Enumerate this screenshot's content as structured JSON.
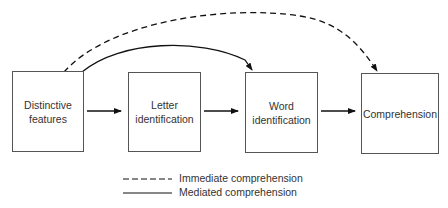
{
  "diagram": {
    "nodes": [
      {
        "id": "distinctive-features",
        "label": "Distinctive\nfeatures"
      },
      {
        "id": "letter-identification",
        "label": "Letter\nidentification"
      },
      {
        "id": "word-identification",
        "label": "Word\nidentification"
      },
      {
        "id": "comprehension",
        "label": "Comprehension"
      }
    ],
    "edges": [
      {
        "from": "distinctive-features",
        "to": "letter-identification",
        "style": "solid"
      },
      {
        "from": "letter-identification",
        "to": "word-identification",
        "style": "solid"
      },
      {
        "from": "word-identification",
        "to": "comprehension",
        "style": "solid"
      },
      {
        "from": "distinctive-features",
        "to": "word-identification",
        "style": "solid-curved"
      },
      {
        "from": "distinctive-features",
        "to": "comprehension",
        "style": "dashed-curved"
      }
    ],
    "legend": [
      {
        "style": "dashed",
        "label": "Immediate comprehension"
      },
      {
        "style": "solid",
        "label": "Mediated comprehension"
      }
    ],
    "colors": {
      "line": "#111111",
      "box_border": "#555555",
      "text": "#333333"
    }
  }
}
